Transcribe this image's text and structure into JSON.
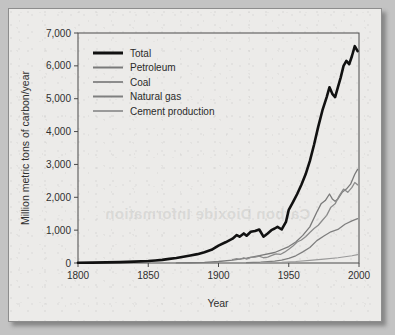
{
  "figure": {
    "background_color": "#ecebe9",
    "border_color": "#8d8d8d"
  },
  "chart_data": {
    "type": "line",
    "title": "",
    "xlabel": "Year",
    "ylabel": "Million metric tons of carbon/year",
    "xlim": [
      1800,
      2000
    ],
    "ylim": [
      0,
      7000
    ],
    "xticks": [
      1800,
      1850,
      1900,
      1950,
      2000
    ],
    "xtick_labels": [
      "1800",
      "1850",
      "1900",
      "1950",
      "2000"
    ],
    "yticks": [
      0,
      1000,
      2000,
      3000,
      4000,
      5000,
      6000,
      7000
    ],
    "ytick_labels": [
      "0",
      "1,000",
      "2,000",
      "3,000",
      "4,000",
      "5,000",
      "6,000",
      "7,000"
    ],
    "grid": false,
    "legend_position": "upper left",
    "series": [
      {
        "name": "Total",
        "color": "#111111",
        "width": 2.6,
        "x": [
          1800,
          1810,
          1820,
          1830,
          1840,
          1850,
          1855,
          1860,
          1865,
          1870,
          1875,
          1880,
          1885,
          1890,
          1895,
          1900,
          1905,
          1910,
          1913,
          1915,
          1918,
          1920,
          1923,
          1926,
          1929,
          1932,
          1935,
          1938,
          1940,
          1942,
          1945,
          1948,
          1950,
          1953,
          1956,
          1959,
          1962,
          1965,
          1968,
          1971,
          1974,
          1977,
          1979,
          1981,
          1983,
          1985,
          1987,
          1989,
          1991,
          1993,
          1995,
          1997,
          1999
        ],
        "y": [
          8,
          12,
          18,
          27,
          42,
          60,
          78,
          95,
          125,
          150,
          190,
          230,
          270,
          330,
          400,
          530,
          630,
          740,
          850,
          800,
          900,
          830,
          950,
          975,
          1020,
          800,
          900,
          1010,
          1050,
          1100,
          1020,
          1250,
          1620,
          1850,
          2100,
          2380,
          2700,
          3100,
          3600,
          4150,
          4650,
          5050,
          5350,
          5150,
          5050,
          5350,
          5650,
          6000,
          6150,
          6050,
          6300,
          6600,
          6450
        ]
      },
      {
        "name": "Petroleum",
        "color": "#7a7a7a",
        "width": 1.3,
        "x": [
          1870,
          1880,
          1890,
          1900,
          1910,
          1920,
          1930,
          1940,
          1950,
          1955,
          1960,
          1965,
          1970,
          1973,
          1976,
          1979,
          1981,
          1983,
          1985,
          1988,
          1991,
          1994,
          1997,
          1999
        ],
        "y": [
          3,
          8,
          20,
          45,
          85,
          150,
          230,
          320,
          500,
          640,
          840,
          1100,
          1550,
          1800,
          1900,
          2100,
          1950,
          1880,
          1950,
          2150,
          2250,
          2400,
          2700,
          2850
        ]
      },
      {
        "name": "Coal",
        "color": "#8c8c8c",
        "width": 1.3,
        "x": [
          1910,
          1913,
          1915,
          1918,
          1920,
          1923,
          1926,
          1929,
          1932,
          1935,
          1938,
          1941,
          1944,
          1947,
          1950,
          1953,
          1956,
          1959,
          1962,
          1965,
          1968,
          1971,
          1974,
          1977,
          1980,
          1983,
          1986,
          1989,
          1992,
          1995,
          1997,
          1999
        ],
        "y": [
          100,
          130,
          110,
          160,
          120,
          170,
          180,
          210,
          160,
          180,
          230,
          280,
          260,
          330,
          420,
          520,
          640,
          700,
          800,
          930,
          1050,
          1150,
          1300,
          1450,
          1700,
          1800,
          2050,
          2250,
          2150,
          2300,
          2450,
          2380
        ]
      },
      {
        "name": "Natural gas",
        "color": "#7f7f7f",
        "width": 1.3,
        "x": [
          1920,
          1930,
          1940,
          1945,
          1950,
          1955,
          1960,
          1965,
          1970,
          1975,
          1980,
          1985,
          1990,
          1995,
          1999
        ],
        "y": [
          10,
          25,
          60,
          85,
          140,
          220,
          340,
          470,
          680,
          820,
          950,
          1020,
          1180,
          1280,
          1350
        ]
      },
      {
        "name": "Cement production",
        "color": "#9a9a9a",
        "width": 1.2,
        "x": [
          1930,
          1945,
          1955,
          1965,
          1975,
          1985,
          1995,
          1999
        ],
        "y": [
          10,
          20,
          45,
          80,
          120,
          160,
          220,
          255
        ]
      }
    ]
  },
  "legend": {
    "entries": [
      {
        "label": "Total",
        "color": "#111111",
        "thickness": "3px"
      },
      {
        "label": "Petroleum",
        "color": "#7a7a7a",
        "thickness": "2px"
      },
      {
        "label": "Coal",
        "color": "#8c8c8c",
        "thickness": "2px"
      },
      {
        "label": "Natural gas",
        "color": "#7f7f7f",
        "thickness": "2px"
      },
      {
        "label": "Cement production",
        "color": "#9a9a9a",
        "thickness": "2px"
      }
    ]
  },
  "watermark": {
    "text": "Carbon Dioxide Information"
  }
}
